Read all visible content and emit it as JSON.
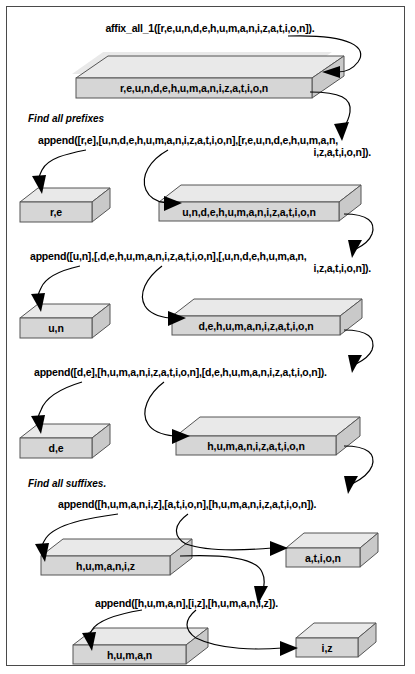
{
  "figure": {
    "title_call": "affix_all_1([r,e,u,n,d,e,h,u,m,a,n,i,z,a,t,i,o,n]).",
    "section_prefixes": "Find all prefixes",
    "section_suffixes": "Find all suffixes.",
    "colors": {
      "front_face": "#d6d6d6",
      "top_face": "#e9e9e9",
      "side_face": "#c9c9c9",
      "outline": "#555555",
      "frame": "#4a4a4a",
      "text": "#000000",
      "background": "#ffffff"
    }
  },
  "calls": {
    "call1_line1": "append([r,e],[u,n,d,e,h,u,m,a,n,i,z,a,t,i,o,n],[r,e,u,n,d,e,h,u,m,a,n,",
    "call1_line2": "i,z,a,t,i,o,n]).",
    "call2_line1": "append([u,n],[,d,e,h,u,m,a,n,i,z,a,t,i,o,n],[,u,n,d,e,h,u,m,a,n,",
    "call2_line2": "i,z,a,t,i,o,n]).",
    "call3": "append([d,e],[h,u,m,a,n,i,z,a,t,i,o,n],[d,e,h,u,m,a,n,i,z,a,t,i,o,n]).",
    "call4": "append([h,u,m,a,n,i,z],[a,t,i,o,n],[h,u,m,a,n,i,z,a,t,i,o,n]).",
    "call5": "append([h,u,m,a,n],[i,z],[h,u,m,a,n,i,z])."
  },
  "slabs": [
    {
      "id": "root",
      "label": "r,e,u,n,d,e,h,u,m,a,n,i,z,a,t,i,o,n"
    },
    {
      "id": "prefix-re",
      "label": "r,e"
    },
    {
      "id": "rest-unde",
      "label": "u,n,d,e,h,u,m,a,n,i,z,a,t,i,o,n"
    },
    {
      "id": "prefix-un",
      "label": "u,n"
    },
    {
      "id": "rest-dehu",
      "label": "d,e,h,u,m,a,n,i,z,a,t,i,o,n"
    },
    {
      "id": "prefix-de",
      "label": "d,e"
    },
    {
      "id": "rest-human",
      "label": "h,u,m,a,n,i,z,a,t,i,o,n"
    },
    {
      "id": "suffix-left",
      "label": "h,u,m,a,n,i,z"
    },
    {
      "id": "suffix-ation",
      "label": "a,t,i,o,n"
    },
    {
      "id": "suffix-human",
      "label": "h,u,m,a,n"
    },
    {
      "id": "suffix-iz",
      "label": "i,z"
    }
  ]
}
